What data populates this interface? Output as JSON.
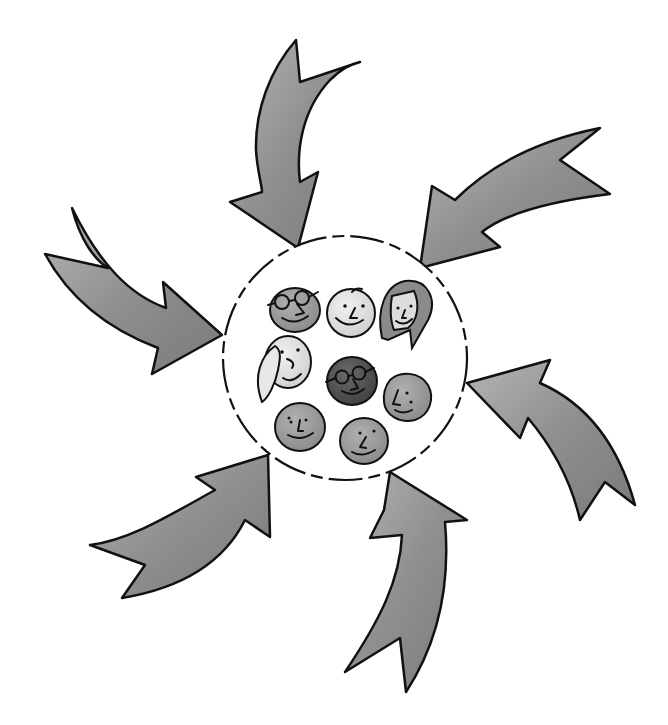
{
  "diagram": {
    "colors": {
      "arrow_fill": "#8f8f8f",
      "arrow_fill_light": "#b4b4b4",
      "outline": "#111111",
      "background": "#ffffff",
      "face_dark": "#4a4a4a",
      "face_mid": "#8a8a8a",
      "face_light": "#d4d4d4",
      "face_lighter": "#e6e6e6"
    },
    "center_group": {
      "label": "Group of people",
      "shape": "dashed-circle",
      "member_count": 8
    },
    "arrows": [
      {
        "id": "top",
        "direction": "pointing-down-into-group"
      },
      {
        "id": "top-right",
        "direction": "pointing-down-left-into-group"
      },
      {
        "id": "left",
        "direction": "pointing-right-into-group"
      },
      {
        "id": "right",
        "direction": "pointing-up-left-into-group"
      },
      {
        "id": "bottom-left",
        "direction": "pointing-up-right-into-group"
      },
      {
        "id": "bottom",
        "direction": "pointing-up-into-group"
      }
    ],
    "faces": [
      {
        "id": "glasses-man-top",
        "features": "glasses"
      },
      {
        "id": "light-bald",
        "features": "plain"
      },
      {
        "id": "long-hair-woman",
        "features": "long hair"
      },
      {
        "id": "blonde-woman",
        "features": "side hair"
      },
      {
        "id": "glasses-man-dark",
        "features": "glasses"
      },
      {
        "id": "side-profile",
        "features": "plain"
      },
      {
        "id": "light-bottom-left",
        "features": "plain"
      },
      {
        "id": "mid-bottom",
        "features": "plain"
      }
    ]
  }
}
